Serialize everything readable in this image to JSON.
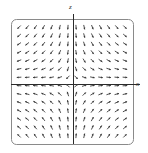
{
  "chart_data": {
    "type": "scatter",
    "title": "",
    "subtitle": "",
    "xlabel": "x",
    "ylabel": "z",
    "grid": false,
    "legend": null,
    "xlim": [
      -7,
      7
    ],
    "ylim": [
      -7,
      7
    ],
    "field": {
      "kind": "vector-field",
      "columns": 14,
      "rows": 14,
      "arrow_count": 196,
      "arrow_color": "#3a3a3a",
      "arrow_length_px": 4.6,
      "formula_u": "x",
      "formula_v": "-z",
      "x_values": [
        -6.5,
        -5.5,
        -4.5,
        -3.5,
        -2.5,
        -1.5,
        -0.5,
        0.5,
        1.5,
        2.5,
        3.5,
        4.5,
        5.5,
        6.5
      ],
      "z_values": [
        6.5,
        5.5,
        4.5,
        3.5,
        2.5,
        1.5,
        0.5,
        -0.5,
        -1.5,
        -2.5,
        -3.5,
        -4.5,
        -5.5,
        -6.5
      ]
    },
    "axes": {
      "horizontal_axis_label": "x",
      "horizontal_axis_y_px": 84,
      "vertical_axis_label": "z",
      "vertical_axis_x_px": 73,
      "axis_color": "#2b2b2b"
    },
    "frame": {
      "shape": "rounded-rectangle",
      "left_px": 11,
      "top_px": 19,
      "right_px": 133,
      "bottom_px": 144,
      "corner_radius_px": 5,
      "stroke_color": "#8a8a8a"
    }
  },
  "plot": {
    "label_z": "z",
    "label_x": "x",
    "background_color": "#ffffff"
  }
}
